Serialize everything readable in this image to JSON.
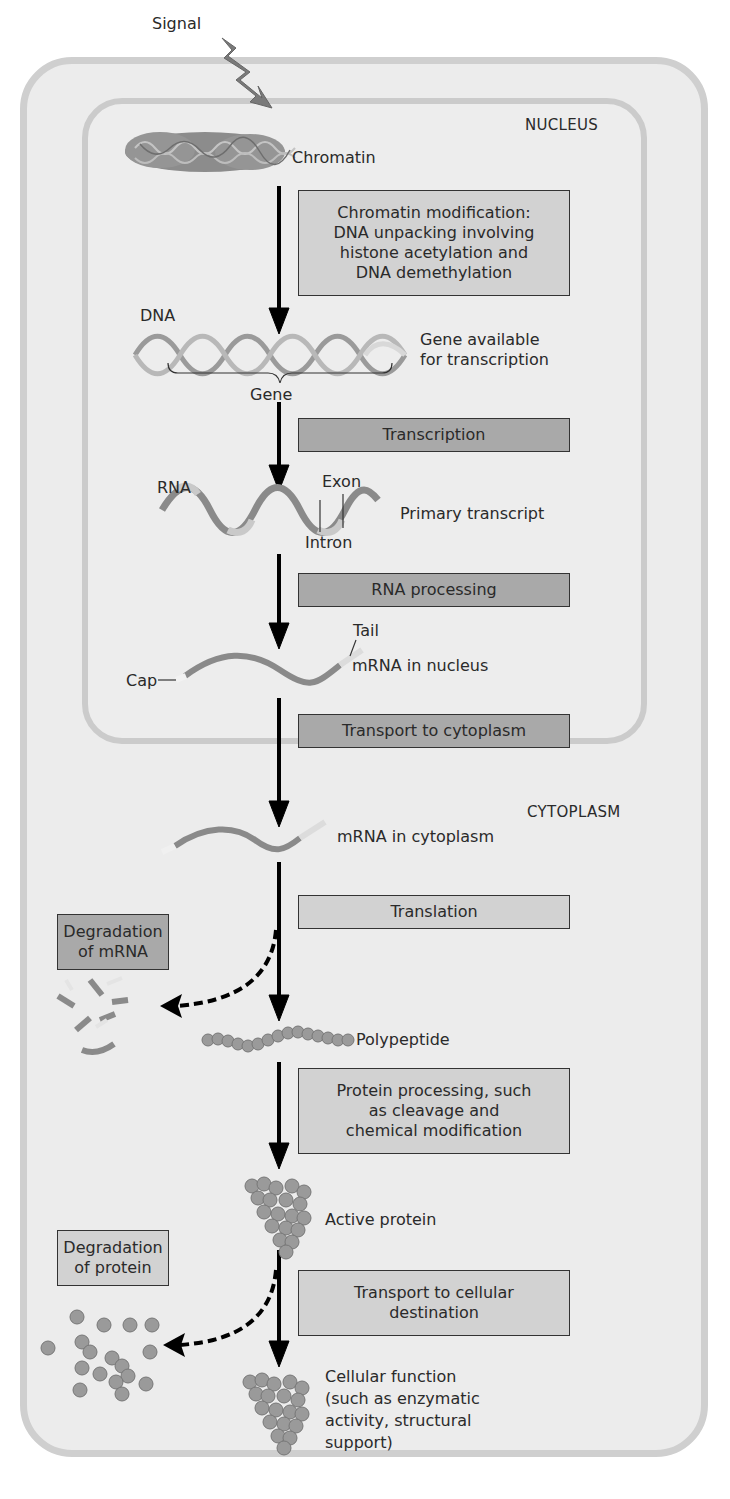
{
  "signal": {
    "label": "Signal"
  },
  "regions": {
    "nucleus": "NUCLEUS",
    "cytoplasm": "CYTOPLASM"
  },
  "structures": {
    "chromatin": "Chromatin",
    "dna": "DNA",
    "gene_available": "Gene available\nfor transcription",
    "gene": "Gene",
    "rna": "RNA",
    "exon": "Exon",
    "intron": "Intron",
    "primary_transcript": "Primary transcript",
    "tail": "Tail",
    "cap": "Cap",
    "mrna_nucleus": "mRNA in nucleus",
    "mrna_cytoplasm": "mRNA in cytoplasm",
    "polypeptide": "Polypeptide",
    "active_protein": "Active protein",
    "cellular_function": "Cellular function\n(such as enzymatic\nactivity, structural\nsupport)"
  },
  "steps": {
    "chromatin_modification": "Chromatin modification:\nDNA unpacking involving\nhistone acetylation and\nDNA demethylation",
    "transcription": "Transcription",
    "rna_processing": "RNA processing",
    "transport_cytoplasm": "Transport to cytoplasm",
    "translation": "Translation",
    "protein_processing": "Protein processing, such\nas cleavage and\nchemical modification",
    "transport_destination": "Transport to cellular\ndestination",
    "degradation_mrna": "Degradation\nof mRNA",
    "degradation_protein": "Degradation\nof protein"
  },
  "colors": {
    "cell_fill": "#ececec",
    "cell_border": "#cfcfcf",
    "box_light": "#d2d2d2",
    "box_dark": "#a9a9a9",
    "arrow": "#000000",
    "molecule": "#8a8a8a"
  }
}
